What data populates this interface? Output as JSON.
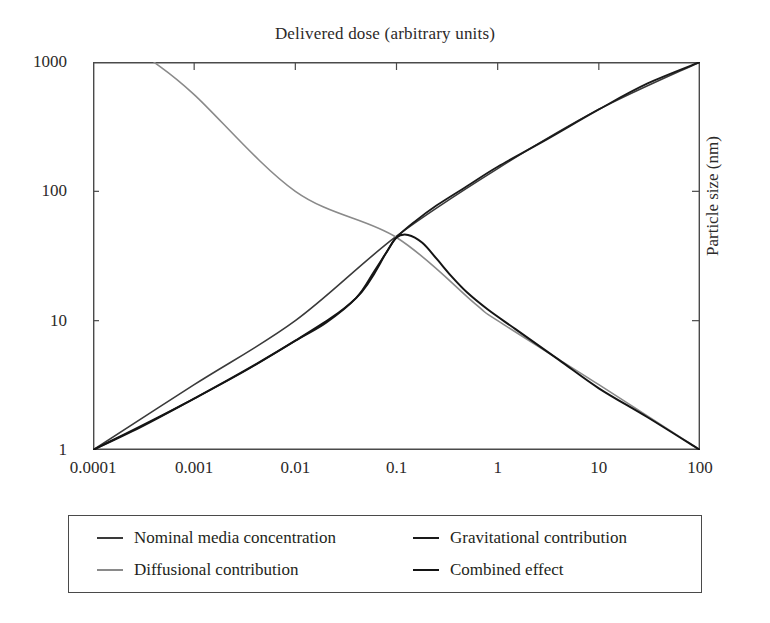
{
  "chart_data": {
    "type": "line",
    "title": "Delivered dose (arbitrary units)",
    "xlabel": "",
    "ylabel": "",
    "y2label": "Particle size  (nm)",
    "xscale": "log",
    "yscale": "log",
    "xlim": [
      0.0001,
      100
    ],
    "ylim": [
      1,
      1000
    ],
    "grid": false,
    "legend_position": "below-plot",
    "xticks": [
      "0.0001",
      "0.001",
      "0.01",
      "0.1",
      "1",
      "10",
      "100"
    ],
    "xtick_values": [
      0.0001,
      0.001,
      0.01,
      0.1,
      1,
      10,
      100
    ],
    "yticks": [
      "1",
      "10",
      "100",
      "1000"
    ],
    "ytick_values": [
      1,
      10,
      100,
      1000
    ],
    "series": [
      {
        "name": "Nominal media concentration",
        "color": "#3a3a3a",
        "width": 1.6,
        "note": "near-straight rising line, hidden beneath gravitational/combined at upper right",
        "points": [
          [
            0.0001,
            1.0
          ],
          [
            0.001,
            3.2
          ],
          [
            0.01,
            10
          ],
          [
            0.1,
            45
          ],
          [
            1,
            150
          ],
          [
            10,
            430
          ],
          [
            100,
            1000
          ]
        ]
      },
      {
        "name": "Gravitational contribution",
        "color": "#1a1a1a",
        "width": 1.8,
        "note": "S-shaped rise from bottom-left to top-right",
        "points": [
          [
            0.0001,
            1.0
          ],
          [
            0.00032,
            1.55
          ],
          [
            0.001,
            2.5
          ],
          [
            0.0032,
            4.1
          ],
          [
            0.01,
            7.0
          ],
          [
            0.02,
            9.6
          ],
          [
            0.04,
            15.0
          ],
          [
            0.06,
            24.0
          ],
          [
            0.08,
            34.0
          ],
          [
            0.1,
            44.0
          ],
          [
            0.15,
            58.0
          ],
          [
            0.25,
            78.0
          ],
          [
            0.5,
            110.0
          ],
          [
            1,
            155.0
          ],
          [
            3,
            250.0
          ],
          [
            10,
            430.0
          ],
          [
            30,
            680.0
          ],
          [
            100,
            1000.0
          ]
        ]
      },
      {
        "name": "Diffusional contribution",
        "color": "#8a8a8a",
        "width": 1.6,
        "note": "straight falling line from top-left to bottom-right",
        "points": [
          [
            0.0004,
            1000
          ],
          [
            0.001,
            560
          ],
          [
            0.01,
            100
          ],
          [
            0.1,
            44
          ],
          [
            0.6,
            13.5
          ],
          [
            1,
            10.0
          ],
          [
            10,
            3.2
          ],
          [
            100,
            1.0
          ]
        ]
      },
      {
        "name": "Combined effect",
        "color": "#141414",
        "width": 2.0,
        "note": "follows gravitational up to ~0.1 then hooks down to join diffusional",
        "points": [
          [
            0.0001,
            1.0
          ],
          [
            0.001,
            2.5
          ],
          [
            0.01,
            7.0
          ],
          [
            0.04,
            15.0
          ],
          [
            0.08,
            34.0
          ],
          [
            0.1,
            44.0
          ],
          [
            0.13,
            46.0
          ],
          [
            0.18,
            40.0
          ],
          [
            0.25,
            30.0
          ],
          [
            0.35,
            22.0
          ],
          [
            0.5,
            16.5
          ],
          [
            0.8,
            12.2
          ],
          [
            1.5,
            8.6
          ],
          [
            4,
            5.0
          ],
          [
            10,
            3.0
          ],
          [
            30,
            1.8
          ],
          [
            100,
            1.0
          ]
        ]
      }
    ]
  },
  "legend": {
    "items": [
      {
        "label": "Nominal media concentration",
        "color": "#3a3a3a",
        "width": 2.2
      },
      {
        "label": "Gravitational contribution",
        "color": "#1a1a1a",
        "width": 2.6
      },
      {
        "label": "Diffusional contribution",
        "color": "#8a8a8a",
        "width": 2.2
      },
      {
        "label": "Combined effect",
        "color": "#141414",
        "width": 2.8
      }
    ]
  },
  "axis": {
    "frame_color": "#4a4a4a",
    "tick_color": "#4a4a4a"
  }
}
